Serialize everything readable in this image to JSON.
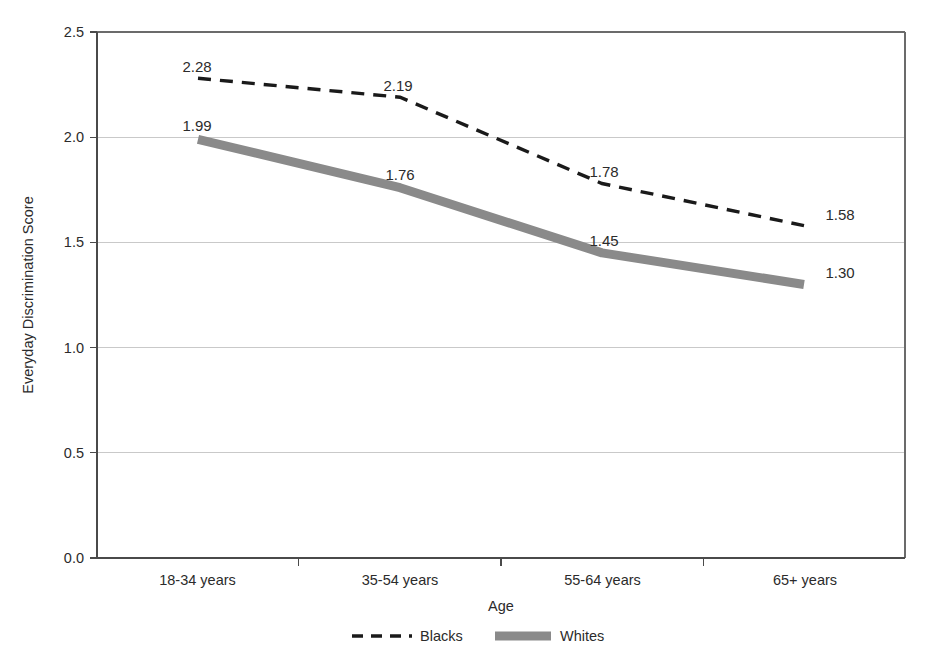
{
  "chart_data": {
    "type": "line",
    "title": "",
    "xlabel": "Age",
    "ylabel": "Everyday Discrimination Score",
    "categories": [
      "18-34 years",
      "35-54 years",
      "55-64 years",
      "65+ years"
    ],
    "series": [
      {
        "name": "Blacks",
        "style": "dashed",
        "color": "#1a1a1a",
        "values": [
          2.28,
          2.19,
          1.78,
          1.58
        ],
        "labels": [
          "2.28",
          "2.19",
          "1.78",
          "1.58"
        ]
      },
      {
        "name": "Whites",
        "style": "solid-thick",
        "color": "#8a8a8a",
        "values": [
          1.99,
          1.76,
          1.45,
          1.3
        ],
        "labels": [
          "1.99",
          "1.76",
          "1.45",
          "1.30"
        ]
      }
    ],
    "ylim": [
      0.0,
      2.5
    ],
    "yticks": [
      0.0,
      0.5,
      1.0,
      1.5,
      2.0,
      2.5
    ],
    "ytick_labels": [
      "0.0",
      "0.5",
      "1.0",
      "1.5",
      "2.0",
      "2.5"
    ],
    "grid": true,
    "grid_axis": "y",
    "legend_position": "bottom"
  },
  "axis": {
    "y_title": "Everyday Discrimination Score",
    "x_title": "Age",
    "y_ticks": {
      "t0": "0.0",
      "t1": "0.5",
      "t2": "1.0",
      "t3": "1.5",
      "t4": "2.0",
      "t5": "2.5"
    },
    "x_categories": {
      "c0": "18-34 years",
      "c1": "35-54 years",
      "c2": "55-64 years",
      "c3": "65+ years"
    }
  },
  "labels": {
    "blacks": {
      "p0": "2.28",
      "p1": "2.19",
      "p2": "1.78",
      "p3": "1.58"
    },
    "whites": {
      "p0": "1.99",
      "p1": "1.76",
      "p2": "1.45",
      "p3": "1.30"
    }
  },
  "legend": {
    "item0": "Blacks",
    "item1": "Whites"
  },
  "colors": {
    "blacks_line": "#1a1a1a",
    "whites_line": "#8a8a8a",
    "gridline": "#c9c9c9",
    "axis": "#4a4a4a",
    "text": "#2b2b2b",
    "background": "#ffffff"
  }
}
